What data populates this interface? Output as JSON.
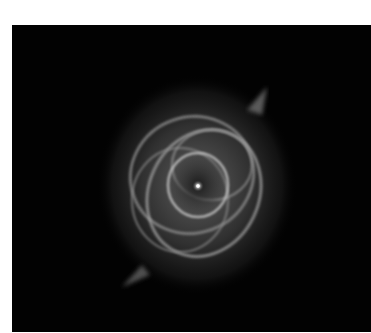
{
  "image": {
    "subject": "planetary nebula (grayscale astronomical photograph)",
    "background_color": "#020202",
    "page_background": "#ffffff",
    "center_star": {
      "x": 197,
      "y": 187
    }
  }
}
